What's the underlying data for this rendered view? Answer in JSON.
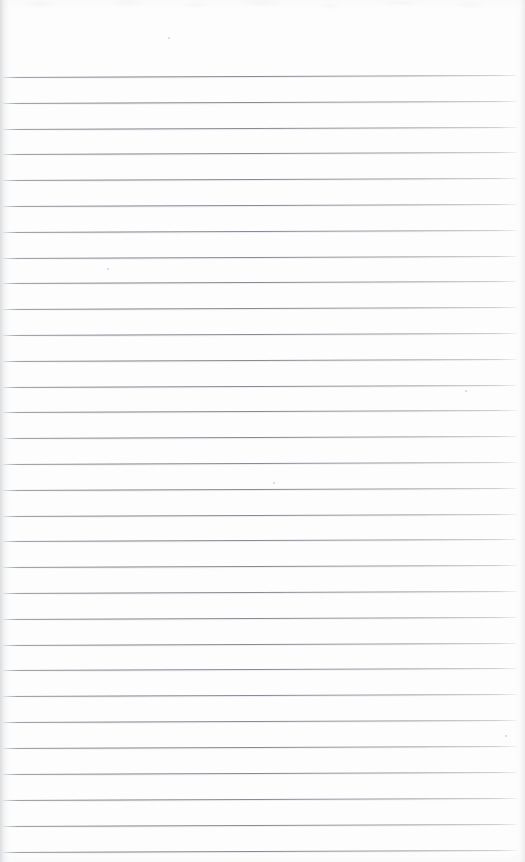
{
  "document": {
    "type": "scanned-page",
    "kind": "blank ruled notebook page",
    "title": "",
    "text_content": "",
    "visible_text": [],
    "page_number": "",
    "width_px": 525,
    "height_px": 862
  },
  "colors": {
    "paper": "#fdfdfd",
    "rule_line": "#767b85",
    "edge_shadow": "#d8dadd",
    "speck": "#b2b5bb"
  },
  "ruling": {
    "line_count": 31,
    "first_line_y": 77,
    "spacing_px": 25.83,
    "line_start_x": 3,
    "line_end_x": 517,
    "skew_deg": -0.22,
    "top_margin_px": 76,
    "bottom_last_line_y": 852
  },
  "lines": [
    {
      "index": 1,
      "y": 77,
      "text": ""
    },
    {
      "index": 2,
      "y": 103,
      "text": ""
    },
    {
      "index": 3,
      "y": 129,
      "text": ""
    },
    {
      "index": 4,
      "y": 154,
      "text": ""
    },
    {
      "index": 5,
      "y": 180,
      "text": ""
    },
    {
      "index": 6,
      "y": 206,
      "text": ""
    },
    {
      "index": 7,
      "y": 232,
      "text": ""
    },
    {
      "index": 8,
      "y": 258,
      "text": ""
    },
    {
      "index": 9,
      "y": 283,
      "text": ""
    },
    {
      "index": 10,
      "y": 309,
      "text": ""
    },
    {
      "index": 11,
      "y": 335,
      "text": ""
    },
    {
      "index": 12,
      "y": 361,
      "text": ""
    },
    {
      "index": 13,
      "y": 387,
      "text": ""
    },
    {
      "index": 14,
      "y": 412,
      "text": ""
    },
    {
      "index": 15,
      "y": 438,
      "text": ""
    },
    {
      "index": 16,
      "y": 464,
      "text": ""
    },
    {
      "index": 17,
      "y": 490,
      "text": ""
    },
    {
      "index": 18,
      "y": 516,
      "text": ""
    },
    {
      "index": 19,
      "y": 541,
      "text": ""
    },
    {
      "index": 20,
      "y": 567,
      "text": ""
    },
    {
      "index": 21,
      "y": 593,
      "text": ""
    },
    {
      "index": 22,
      "y": 619,
      "text": ""
    },
    {
      "index": 23,
      "y": 645,
      "text": ""
    },
    {
      "index": 24,
      "y": 670,
      "text": ""
    },
    {
      "index": 25,
      "y": 696,
      "text": ""
    },
    {
      "index": 26,
      "y": 722,
      "text": ""
    },
    {
      "index": 27,
      "y": 748,
      "text": ""
    },
    {
      "index": 28,
      "y": 774,
      "text": ""
    },
    {
      "index": 29,
      "y": 800,
      "text": ""
    },
    {
      "index": 30,
      "y": 826,
      "text": ""
    },
    {
      "index": 31,
      "y": 852,
      "text": ""
    }
  ],
  "specks": [
    {
      "x": 465,
      "y": 390,
      "size": 2
    },
    {
      "x": 505,
      "y": 735,
      "size": 2
    },
    {
      "x": 168,
      "y": 37,
      "size": 2
    },
    {
      "x": 107,
      "y": 268,
      "size": 2
    },
    {
      "x": 273,
      "y": 482,
      "size": 2
    }
  ]
}
